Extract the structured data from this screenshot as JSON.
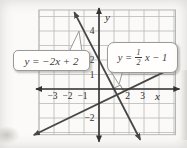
{
  "figure": {
    "background": "#fbfaf8",
    "grid_color": "#b6bab6",
    "axis_color": "#333333",
    "line_color": "#474747",
    "callout_border": "#9a9a9a",
    "text_color": "#3c3c3c"
  },
  "axes": {
    "x_label": "x",
    "y_label": "y",
    "x_ticks": [
      {
        "v": -3,
        "label": "−3"
      },
      {
        "v": -2,
        "label": "−2"
      },
      {
        "v": -1,
        "label": "−1"
      },
      {
        "v": 2,
        "label": "2"
      },
      {
        "v": 3,
        "label": "3"
      }
    ],
    "y_ticks": [
      {
        "v": 4,
        "label": "4"
      },
      {
        "v": 2,
        "label": "2"
      },
      {
        "v": 1,
        "label": "1"
      },
      {
        "v": -2,
        "label": "−2"
      }
    ]
  },
  "callouts": {
    "line1": {
      "label": "y = −2x + 2"
    },
    "line2": {
      "lhs": "y =",
      "numerator": "1",
      "denominator": "2",
      "rhs": "x − 1"
    }
  },
  "chart_data": {
    "type": "line",
    "title": "",
    "xlabel": "x",
    "ylabel": "y",
    "xlim": [
      -4,
      5.1
    ],
    "ylim": [
      -3.15,
      5.45
    ],
    "grid": true,
    "legend": "callout boxes pointing at each line",
    "series": [
      {
        "name": "y = −2x + 2",
        "slope": -2,
        "intercept": 2,
        "draw_x": [
          -1.65,
          2.75
        ]
      },
      {
        "name": "y = (1/2)x − 1",
        "slope": 0.5,
        "intercept": -1,
        "draw_x": [
          -4.35,
          5.15
        ]
      }
    ],
    "intersection": {
      "x": 1.2,
      "y": -0.4,
      "right_angle_marker": true,
      "marker_size": 0.5
    }
  }
}
